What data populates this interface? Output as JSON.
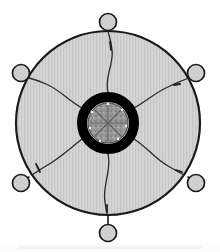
{
  "figure": {
    "name": "radial-disc-diagram",
    "background_color": "#ffffff"
  },
  "colors": {
    "outline": "#1a1a1a",
    "disc_fill_light": "#d6d6d6",
    "disc_fill_stripe": "#c6c6c6",
    "ring_black": "#000000",
    "hub_fill": "#9a9a9a",
    "hub_speckle_dark": "#6e6e6e",
    "hub_speckle_light": "#b8b8b8",
    "node_fill": "#d2d2d2",
    "node_outline": "#1a1a1a",
    "filament": "#2a2a2a",
    "shadow": "#e8e8e8"
  },
  "geometry": {
    "canvas_width": 220,
    "canvas_height": 252,
    "center_x": 108,
    "center_y": 123,
    "disc_radius": 92,
    "disc_stroke_width": 2.2,
    "ring_outer_radius": 31,
    "ring_inner_radius": 21,
    "hub_radius": 20,
    "node_radius": 8.5,
    "filament_width": 1.3
  },
  "disc": {
    "label": "outer-disc",
    "fill_pattern": "vertical-hatch",
    "stripe_period_px": 3
  },
  "ring": {
    "label": "thick-black-ring",
    "description": "dense dark annulus surrounding the central hub"
  },
  "hub": {
    "label": "central-hub",
    "description": "speckled grey core with short internal spokes",
    "internal_spoke_count": 8
  },
  "nodes": [
    {
      "id": "node-n",
      "label": "N",
      "angle_deg": 270,
      "cx": 108,
      "cy": 22,
      "stem_to": [
        108,
        31
      ]
    },
    {
      "id": "node-ne",
      "label": "NE",
      "angle_deg": 330,
      "cx": 196,
      "cy": 73,
      "stem_to": [
        188,
        78
      ]
    },
    {
      "id": "node-se",
      "label": "SE",
      "angle_deg": 30,
      "cx": 196,
      "cy": 183,
      "stem_to": [
        188,
        177
      ]
    },
    {
      "id": "node-s",
      "label": "S",
      "angle_deg": 90,
      "cx": 108,
      "cy": 233,
      "stem_to": [
        108,
        216
      ]
    },
    {
      "id": "node-sw",
      "label": "SW",
      "angle_deg": 150,
      "cx": 21,
      "cy": 183,
      "stem_to": [
        29,
        177
      ]
    },
    {
      "id": "node-nw",
      "label": "NW",
      "angle_deg": 210,
      "cx": 21,
      "cy": 73,
      "stem_to": [
        29,
        78
      ]
    }
  ],
  "filaments": [
    {
      "id": "filament-n",
      "target": "node-n",
      "path": "M 108 92 C 104 78 114 64 112 50 C 111 40 109 36 108 31"
    },
    {
      "id": "filament-ne",
      "target": "node-ne",
      "path": "M 134 108 C 148 100 156 92 170 86 C 179 82 184 80 188 78"
    },
    {
      "id": "filament-se",
      "target": "node-se",
      "path": "M 134 139 C 148 148 154 158 168 166 C 178 172 184 175 188 177"
    },
    {
      "id": "filament-s",
      "target": "node-s",
      "path": "M 108 154 C 112 170 102 186 105 202 C 106 211 107 214 108 216"
    },
    {
      "id": "filament-sw",
      "target": "node-sw",
      "path": "M 82 139 C 68 150 60 158 46 166 C 37 171 33 175 29 177"
    },
    {
      "id": "filament-nw",
      "target": "node-nw",
      "path": "M 82 108 C 68 100 60 90 46 84 C 37 80 33 79 29 78"
    }
  ],
  "tick_marks": [
    {
      "id": "tick-n",
      "x1": 110,
      "y1": 42,
      "x2": 111,
      "y2": 50
    },
    {
      "id": "tick-ne",
      "x1": 174,
      "y1": 85,
      "x2": 180,
      "y2": 84
    },
    {
      "id": "tick-sw",
      "x1": 36,
      "y1": 164,
      "x2": 40,
      "y2": 172
    },
    {
      "id": "tick-se",
      "x1": 176,
      "y1": 170,
      "x2": 182,
      "y2": 172
    },
    {
      "id": "tick-s",
      "x1": 107,
      "y1": 205,
      "x2": 107,
      "y2": 212
    }
  ]
}
